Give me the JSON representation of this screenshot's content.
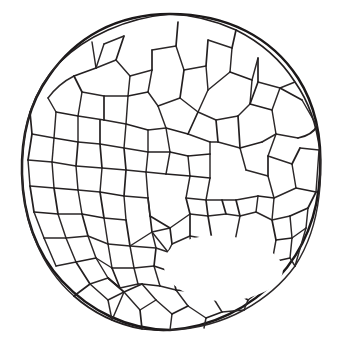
{
  "figure": {
    "kind": "botanical-cross-section-line-drawing",
    "background_color": "#ffffff",
    "ink_color": "#231f20",
    "outline_color": "#1b1819",
    "canvas": {
      "width": 337,
      "height": 349
    },
    "outer_boundary": {
      "name": "epidermis-outline",
      "shape": "circle",
      "center_x": 170,
      "center_y": 172,
      "radius_x": 148,
      "radius_y": 158,
      "stroke_width": 2.5
    },
    "lacuna": {
      "name": "central-air-cavity",
      "label": "large central cavity",
      "center_x": 218,
      "center_y": 262,
      "approx_width": 130,
      "approx_height": 86
    },
    "cell_counts": {
      "total_visible": 172,
      "large_parenchyma": 34,
      "small_peripheral": 96
    },
    "geometry": {
      "outer_ellipse": "M 170,14 C 228,14 272,38 298,78 C 316,106 322,140 320,174 C 318,214 304,250 278,278 C 250,308 212,327 170,330 C 128,330 90,311 62,281 C 36,253 23,215 22,174 C 21,138 29,104 49,76 C 75,38 116,14 170,14 Z",
      "walls": [
        "M 170,14 C 148,16 126,22 108,30 C 90,38 74,48 60,62",
        "M 60,62 C 46,76 36,94 30,112 C 25,128 22,150 22,174",
        "M 22,174 C 23,198 27,222 36,242 C 45,264 58,282 74,296",
        "M 74,296 C 92,312 116,324 142,329 C 152,330 162,331 170,330",
        "M 170,330 C 196,329 222,322 244,310 C 264,299 282,284 295,266",
        "M 295,266 C 308,246 316,222 319,196 C 321,180 321,166 320,152",
        "M 320,152 C 317,126 309,102 295,82 C 281,60 260,42 236,30 C 216,21 194,15 170,14",
        "M 92,42 L 96,68",
        "M 96,68 L 104,44",
        "M 96,68 L 74,76",
        "M 74,76 C 62,82 54,90 48,98",
        "M 96,68 L 116,60",
        "M 116,60 L 124,36",
        "M 116,60 L 130,76",
        "M 130,76 L 152,70",
        "M 152,70 L 152,50",
        "M 152,70 L 148,92",
        "M 152,50 L 176,46",
        "M 176,46 L 178,22",
        "M 176,46 L 184,70",
        "M 184,70 L 206,66",
        "M 206,66 L 208,40",
        "M 206,66 L 208,90",
        "M 208,40 L 232,48",
        "M 232,48 L 236,30",
        "M 232,48 L 230,72",
        "M 230,72 L 208,90",
        "M 230,72 L 252,80",
        "M 252,80 L 258,58",
        "M 252,80 L 250,104",
        "M 250,104 L 272,110",
        "M 272,110 L 280,88",
        "M 280,88 L 295,82",
        "M 280,88 L 302,100",
        "M 272,110 L 276,134",
        "M 276,134 L 298,138",
        "M 298,138 C 308,136 314,132 317,126",
        "M 276,134 L 268,156",
        "M 268,156 L 292,164",
        "M 292,164 L 300,148",
        "M 300,148 L 319,150",
        "M 292,164 L 296,188",
        "M 296,188 L 316,192",
        "M 296,188 L 274,198",
        "M 274,198 L 268,176",
        "M 268,176 L 268,156",
        "M 268,176 L 246,170",
        "M 246,170 L 240,148",
        "M 240,148 L 262,142",
        "M 262,142 L 276,134",
        "M 240,148 L 218,142",
        "M 218,142 L 216,120",
        "M 216,120 L 238,116",
        "M 238,116 L 250,104",
        "M 238,116 L 240,148",
        "M 216,120 L 198,112",
        "M 198,112 L 208,90",
        "M 198,112 L 188,134",
        "M 188,134 L 210,142",
        "M 210,142 L 218,142",
        "M 188,134 L 166,128",
        "M 166,128 L 158,106",
        "M 158,106 L 180,98",
        "M 180,98 L 184,70",
        "M 180,98 L 198,112",
        "M 158,106 L 148,92",
        "M 148,92 L 128,96",
        "M 128,96 L 130,76",
        "M 128,96 L 126,124",
        "M 126,124 L 148,130",
        "M 148,130 L 166,128",
        "M 126,124 L 104,120",
        "M 104,120 L 104,96",
        "M 104,96 L 128,96",
        "M 104,96 L 82,92",
        "M 82,92 L 74,76",
        "M 82,92 L 78,116",
        "M 78,116 L 104,120",
        "M 78,116 L 56,112",
        "M 56,112 L 48,98",
        "M 56,112 L 54,138",
        "M 54,138 L 78,142",
        "M 78,142 L 78,116",
        "M 54,138 L 32,134",
        "M 32,134 L 30,112",
        "M 54,138 L 52,162",
        "M 52,162 L 76,166",
        "M 76,166 L 78,142",
        "M 52,162 L 28,160",
        "M 52,162 L 54,188",
        "M 54,188 L 78,190",
        "M 78,190 L 76,166",
        "M 54,188 L 30,186",
        "M 54,188 L 58,214",
        "M 58,214 L 82,214",
        "M 82,214 L 78,190",
        "M 58,214 L 34,212",
        "M 58,214 L 66,238",
        "M 66,238 L 88,236",
        "M 88,236 L 82,214",
        "M 66,238 L 44,238",
        "M 66,238 L 76,262",
        "M 76,262 L 96,258",
        "M 96,258 L 88,236",
        "M 76,262 L 56,266",
        "M 76,262 L 90,284",
        "M 90,284 L 108,278",
        "M 108,278 L 96,258",
        "M 90,284 L 74,296",
        "M 90,284 L 108,300",
        "M 108,300 L 124,292",
        "M 124,292 L 108,278",
        "M 108,300 L 112,320",
        "M 124,292 L 140,310",
        "M 140,310 L 142,329",
        "M 140,310 L 156,300",
        "M 156,300 L 142,284",
        "M 142,284 L 124,292",
        "M 156,300 L 172,314",
        "M 172,314 L 170,330",
        "M 172,314 L 188,306",
        "M 188,306 L 176,290",
        "M 176,290 L 160,286",
        "M 160,286 L 142,284",
        "M 188,306 L 206,318",
        "M 206,318 L 204,328",
        "M 206,318 L 222,312",
        "M 222,312 L 212,296",
        "M 212,296 L 196,292",
        "M 196,292 L 176,290",
        "M 222,312 L 244,310",
        "M 212,296 L 232,290",
        "M 232,290 L 248,300",
        "M 248,300 L 244,310",
        "M 232,290 L 248,278",
        "M 248,278 L 264,288",
        "M 264,288 L 248,300",
        "M 264,288 L 278,278",
        "M 248,278 L 252,258",
        "M 252,258 L 272,262",
        "M 272,262 L 264,288",
        "M 272,262 L 290,258",
        "M 290,258 L 295,266",
        "M 272,262 L 276,240",
        "M 276,240 L 292,238",
        "M 292,238 L 290,258",
        "M 292,238 L 306,228",
        "M 276,240 L 272,220",
        "M 272,220 L 290,216",
        "M 290,216 L 292,238",
        "M 290,216 L 308,208",
        "M 272,220 L 256,212",
        "M 256,212 L 258,196",
        "M 258,196 L 274,198",
        "M 274,198 L 272,220",
        "M 256,212 L 240,216",
        "M 240,216 L 236,200",
        "M 236,200 L 258,196",
        "M 240,216 L 226,214",
        "M 226,214 L 222,200",
        "M 222,200 L 236,200",
        "M 226,214 L 208,216",
        "M 208,216 L 206,200",
        "M 206,200 L 222,200",
        "M 208,216 L 190,214",
        "M 190,214 L 186,198",
        "M 186,198 L 206,200",
        "M 186,198 L 190,176",
        "M 190,176 L 210,178",
        "M 210,178 L 206,200",
        "M 190,176 L 188,156",
        "M 188,156 L 210,154",
        "M 210,154 L 210,178",
        "M 210,154 L 210,142",
        "M 188,156 L 170,152",
        "M 170,152 L 166,128",
        "M 170,152 L 166,174",
        "M 166,174 L 190,176",
        "M 166,174 L 146,172",
        "M 146,172 L 148,152",
        "M 148,152 L 170,152",
        "M 148,152 L 148,130",
        "M 146,172 L 126,170",
        "M 126,170 L 124,148",
        "M 124,148 L 148,152",
        "M 124,148 L 126,124",
        "M 126,170 L 124,196",
        "M 124,196 L 148,198",
        "M 148,198 L 146,172",
        "M 124,196 L 100,192",
        "M 100,192 L 102,168",
        "M 102,168 L 126,170",
        "M 102,168 L 100,144",
        "M 100,144 L 124,148",
        "M 100,144 L 78,142",
        "M 100,144 L 100,120",
        "M 102,168 L 76,166",
        "M 100,192 L 78,190",
        "M 100,192 L 104,218",
        "M 104,218 L 126,220",
        "M 126,220 L 124,196",
        "M 104,218 L 82,214",
        "M 104,218 L 108,244",
        "M 108,244 L 130,246",
        "M 130,246 L 126,220",
        "M 108,244 L 88,236",
        "M 108,244 L 112,268",
        "M 112,268 L 134,268",
        "M 134,268 L 130,246",
        "M 112,268 L 96,258",
        "M 112,268 L 120,288",
        "M 120,288 L 138,284",
        "M 138,284 L 134,268",
        "M 120,288 L 108,278",
        "M 138,284 L 142,284",
        "M 134,268 L 154,266",
        "M 154,266 L 156,248",
        "M 156,248 L 130,246",
        "M 154,266 L 160,286",
        "M 154,266 L 172,272",
        "M 172,272 L 168,252",
        "M 168,252 L 156,248",
        "M 172,272 L 176,290",
        "M 168,252 L 152,232",
        "M 152,232 L 156,248",
        "M 152,232 L 148,198",
        "M 152,232 L 130,246",
        "M 152,232 L 170,228",
        "M 170,228 L 172,244",
        "M 172,244 L 168,252",
        "M 170,228 L 190,214",
        "M 170,228 L 150,216",
        "M 150,216 L 148,198",
        "M 196,292 L 192,272",
        "M 192,272 L 172,272",
        "M 192,272 L 212,268",
        "M 212,268 L 212,296",
        "M 212,268 L 232,268",
        "M 232,268 L 232,290",
        "M 232,268 L 252,258",
        "M 232,268 L 234,246",
        "M 234,246 L 252,258",
        "M 234,246 L 240,216",
        "M 234,246 L 212,268",
        "M 234,246 L 212,240",
        "M 212,240 L 212,268",
        "M 212,240 L 208,216",
        "M 212,240 L 190,236",
        "M 190,236 L 192,272",
        "M 190,236 L 190,214",
        "M 190,236 L 172,244",
        "M 30,186 L 28,160",
        "M 34,212 L 30,186",
        "M 44,238 L 34,212",
        "M 56,266 L 44,238",
        "M 28,160 L 32,134",
        "M 302,100 L 317,126",
        "M 316,192 L 319,150",
        "M 308,208 L 316,192",
        "M 306,228 L 308,208",
        "M 295,266 L 306,228",
        "M 250,104 L 258,82",
        "M 112,320 L 124,292",
        "M 104,44 L 124,36",
        "M 258,58 L 258,82",
        "M 258,82 L 280,88"
      ],
      "lacuna_path": "M 172,248 C 186,238 206,234 226,236 C 248,238 268,246 278,258 C 288,270 282,284 264,292 C 244,302 216,304 194,296 C 176,290 164,278 164,266 C 164,258 166,252 172,248 Z"
    }
  }
}
